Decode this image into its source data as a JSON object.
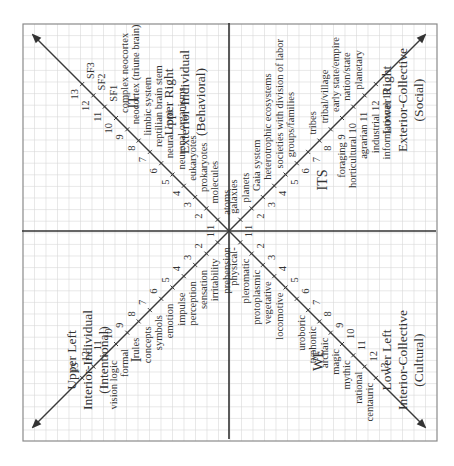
{
  "diagram": {
    "rotation_deg": -90,
    "colors": {
      "grid": "#d9d9d9",
      "frame": "#8a8a8a",
      "axis": "#333333",
      "text": "#333333"
    },
    "quadrants": {
      "upper_left": {
        "title": "Upper Left",
        "subtitle": "Interior-Individual",
        "paren": "(Intentional)",
        "code": "I",
        "levels": [
          "prehension",
          "irritability",
          "sensation",
          "perception",
          "impulse",
          "emotion",
          "symbols",
          "concepts",
          "rules",
          "formal",
          "vision logic",
          "",
          ""
        ]
      },
      "upper_right": {
        "title": "Upper Right",
        "subtitle": "Exterior-Individual",
        "paren": "(Behavioral)",
        "code": "IT",
        "levels": [
          "atoms",
          "molecules",
          "prokaryotes",
          "eukaryotes",
          "neuronal organisms",
          "neural cord",
          "reptilian brain stem",
          "limbic system",
          "neocortex (triune brain)",
          "complex neocortex",
          "SF1",
          "SF2",
          "SF3"
        ]
      },
      "lower_left": {
        "title": "Lower Left",
        "subtitle": "Interior-Collective",
        "paren": "(Cultural)",
        "code": "WE",
        "levels": [
          "physical-",
          "pleromatic",
          "protoplasmic",
          "vegetative",
          "locomotive",
          "",
          "uroboric",
          "typhonic",
          "archaic",
          "magic",
          "mythic",
          "rational",
          "centauric"
        ]
      },
      "lower_right": {
        "title": "Lower Right",
        "subtitle": "Exterior-Collective",
        "paren": "(Social)",
        "code": "ITS",
        "levels_upper": [
          "galaxies",
          "planets",
          "Gaia system",
          "heterotrophic ecosystems",
          "societies with division of labor",
          "groups/families",
          "",
          "tribes",
          "tribal/village",
          "early state/empire",
          "nation/state",
          "planetary",
          ""
        ],
        "levels_lower": [
          "",
          "",
          "",
          "",
          "",
          "",
          "",
          "",
          "foraging",
          "horticultural",
          "agrarian",
          "industrial",
          "informational"
        ]
      }
    },
    "tick_numbers": [
      "1",
      "2",
      "3",
      "4",
      "5",
      "6",
      "7",
      "8",
      "9",
      "10",
      "11",
      "12",
      "13"
    ]
  }
}
